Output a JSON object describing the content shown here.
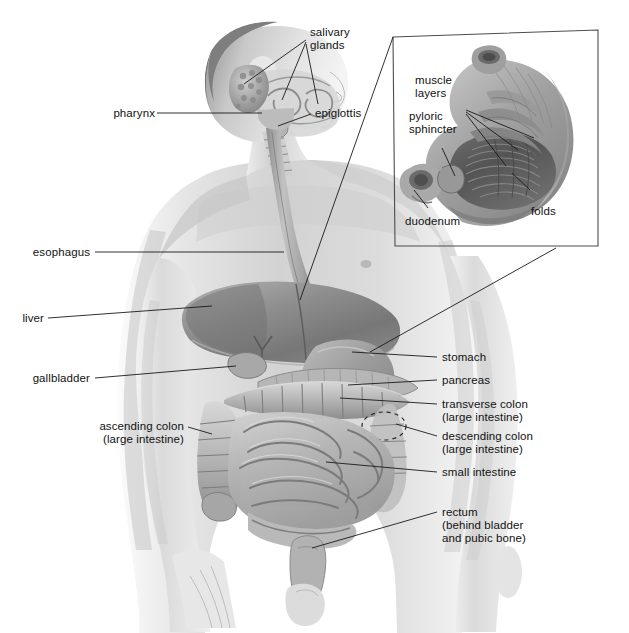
{
  "figure": {
    "background_color": "#ffffff",
    "body_tone": "#d8d8d8",
    "line_color": "#1a1a1a",
    "inset_border_color": "#4d4d4d"
  },
  "labels": {
    "salivary_glands": "salivary\nglands",
    "pharynx": "pharynx",
    "epiglottis": "epiglottis",
    "esophagus": "esophagus",
    "liver": "liver",
    "gallbladder": "gallbladder",
    "ascending_colon": "ascending colon\n(large intestine)",
    "stomach": "stomach",
    "pancreas": "pancreas",
    "transverse_colon": "transverse colon\n(large intestine)",
    "descending_colon": "descending colon\n(large intestine)",
    "small_intestine": "small intestine",
    "rectum": "rectum\n(behind bladder\nand pubic bone)"
  },
  "inset": {
    "name": "stomach-cutaway-detail",
    "labels": {
      "muscle_layers": "muscle\nlayers",
      "pyloric_sphincter": "pyloric\nsphincter",
      "duodenum": "duodenum",
      "folds": "folds"
    }
  }
}
